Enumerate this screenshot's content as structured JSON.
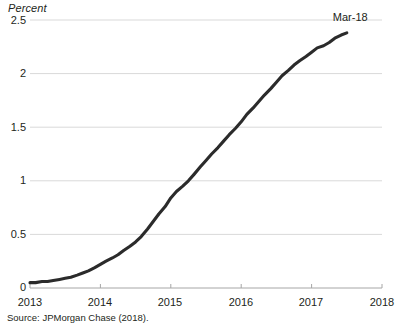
{
  "chart_data": {
    "type": "line",
    "title": "",
    "subtitle": "",
    "ylabel": "Percent",
    "xlabel": "",
    "ylim": [
      0,
      2.5
    ],
    "xlim": [
      2013,
      2018
    ],
    "grid": true,
    "legend": false,
    "legend_position": "none",
    "y_ticks": [
      "2.5",
      "2",
      "1.5",
      "1",
      "0.5",
      "0"
    ],
    "y_tick_values": [
      2.5,
      2,
      1.5,
      1,
      0.5,
      0
    ],
    "x_ticks": [
      "2013",
      "2014",
      "2015",
      "2016",
      "2017",
      "2018"
    ],
    "x_tick_values": [
      2013,
      2014,
      2015,
      2016,
      2017,
      2018
    ],
    "annotations": [
      {
        "text": "Mar-18",
        "x": 2017.5,
        "y": 2.38
      }
    ],
    "series": [
      {
        "name": "Percent",
        "color": "#2b2b2b",
        "x": [
          2013.0,
          2013.08,
          2013.17,
          2013.25,
          2013.33,
          2013.42,
          2013.5,
          2013.58,
          2013.67,
          2013.75,
          2013.83,
          2013.92,
          2014.0,
          2014.08,
          2014.17,
          2014.25,
          2014.33,
          2014.42,
          2014.5,
          2014.58,
          2014.67,
          2014.75,
          2014.83,
          2014.92,
          2015.0,
          2015.08,
          2015.17,
          2015.25,
          2015.33,
          2015.42,
          2015.5,
          2015.58,
          2015.67,
          2015.75,
          2015.83,
          2015.92,
          2016.0,
          2016.08,
          2016.17,
          2016.25,
          2016.33,
          2016.42,
          2016.5,
          2016.58,
          2016.67,
          2016.75,
          2016.83,
          2016.92,
          2017.0,
          2017.08,
          2017.17,
          2017.25,
          2017.33,
          2017.42,
          2017.5
        ],
        "y": [
          0.05,
          0.05,
          0.06,
          0.06,
          0.07,
          0.08,
          0.09,
          0.1,
          0.12,
          0.14,
          0.16,
          0.19,
          0.22,
          0.25,
          0.28,
          0.31,
          0.35,
          0.39,
          0.43,
          0.48,
          0.55,
          0.62,
          0.69,
          0.76,
          0.84,
          0.9,
          0.95,
          1.0,
          1.06,
          1.13,
          1.19,
          1.25,
          1.31,
          1.37,
          1.43,
          1.49,
          1.55,
          1.62,
          1.68,
          1.74,
          1.8,
          1.86,
          1.92,
          1.98,
          2.03,
          2.08,
          2.12,
          2.16,
          2.2,
          2.24,
          2.26,
          2.29,
          2.33,
          2.36,
          2.38
        ]
      }
    ]
  },
  "source": {
    "text": "Source: JPMorgan Chase (2018)."
  }
}
